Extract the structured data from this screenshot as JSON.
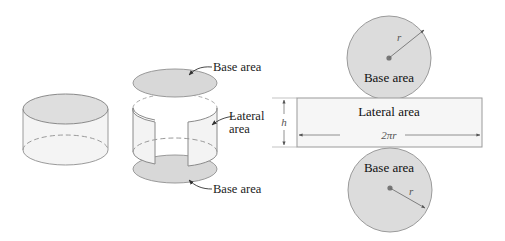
{
  "diagram": {
    "type": "cylinder-surface-area-net",
    "colors": {
      "fill_base": "#dcdcdc",
      "fill_body": "#f2f2f2",
      "stroke": "#8a8a8a",
      "arrow": "#444444",
      "text": "#222222"
    },
    "solid_cylinder": {},
    "exploded_cylinder": {
      "labels": {
        "top_base": "Base area",
        "lateral_line1": "Lateral",
        "lateral_line2": "area",
        "bottom_base": "Base area"
      }
    },
    "net": {
      "top_circle": {
        "label": "Base area",
        "radius_label": "r"
      },
      "rectangle": {
        "label": "Lateral area",
        "height_label": "h",
        "width_label": "2πr"
      },
      "bottom_circle": {
        "label": "Base area",
        "radius_label": "r"
      }
    }
  }
}
